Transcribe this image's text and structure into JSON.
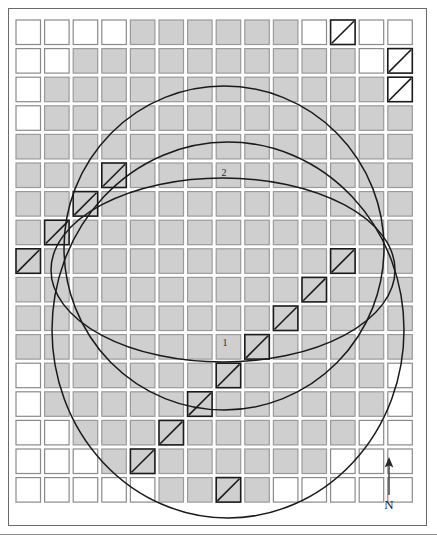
{
  "figure": {
    "type": "map-diagram",
    "title": "",
    "background_color": "#ffffff",
    "frame": {
      "x": 8,
      "y": 8,
      "width": 419,
      "height": 518,
      "stroke": "#6a6a6a"
    }
  },
  "grid": {
    "cols": 14,
    "rows": 17,
    "origin_x": 16,
    "origin_y": 20,
    "pitch_x": 28.6,
    "pitch_y": 28.6,
    "cell_size": 24.5,
    "cell_stroke": "#8a8a8a",
    "cell_stroke_shaded": "#9a9a9a",
    "cell_fill_plain": "#ffffff",
    "cell_fill_shaded": "#cfcfcf",
    "hatch_stroke": "#1a1a1a"
  },
  "shapes": [
    {
      "id": "2",
      "name": "circle-2",
      "kind": "circle",
      "label": "2",
      "label_x": 224,
      "label_y": 172,
      "cx": 224,
      "cy": 248,
      "rx": 160,
      "ry": 162,
      "rotation": 0,
      "stroke": "#1a1a1a",
      "fill": "none"
    },
    {
      "id": "1",
      "name": "circle-1",
      "kind": "circle",
      "label": "1",
      "label_x": 225,
      "label_y": 342,
      "cx": 228,
      "cy": 330,
      "rx": 176,
      "ry": 188,
      "rotation": 0,
      "stroke": "#1a1a1a",
      "fill": "none"
    },
    {
      "id": "ellipse",
      "name": "ellipse-overlay",
      "kind": "ellipse",
      "label": "",
      "cx": 223,
      "cy": 270,
      "rx": 172,
      "ry": 92,
      "rotation": 0,
      "stroke": "#1a1a1a",
      "fill": "none"
    }
  ],
  "shaded_cells": [
    [
      0,
      4
    ],
    [
      0,
      5
    ],
    [
      0,
      6
    ],
    [
      0,
      7
    ],
    [
      0,
      8
    ],
    [
      0,
      9
    ],
    [
      1,
      2
    ],
    [
      1,
      3
    ],
    [
      1,
      4
    ],
    [
      1,
      5
    ],
    [
      1,
      6
    ],
    [
      1,
      7
    ],
    [
      1,
      8
    ],
    [
      1,
      9
    ],
    [
      1,
      10
    ],
    [
      1,
      11
    ],
    [
      2,
      1
    ],
    [
      2,
      2
    ],
    [
      2,
      3
    ],
    [
      2,
      4
    ],
    [
      2,
      5
    ],
    [
      2,
      6
    ],
    [
      2,
      7
    ],
    [
      2,
      8
    ],
    [
      2,
      9
    ],
    [
      2,
      10
    ],
    [
      2,
      11
    ],
    [
      2,
      12
    ],
    [
      3,
      1
    ],
    [
      3,
      2
    ],
    [
      3,
      3
    ],
    [
      3,
      4
    ],
    [
      3,
      5
    ],
    [
      3,
      6
    ],
    [
      3,
      7
    ],
    [
      3,
      8
    ],
    [
      3,
      9
    ],
    [
      3,
      10
    ],
    [
      3,
      11
    ],
    [
      3,
      12
    ],
    [
      3,
      13
    ],
    [
      4,
      0
    ],
    [
      4,
      1
    ],
    [
      4,
      2
    ],
    [
      4,
      3
    ],
    [
      4,
      4
    ],
    [
      4,
      5
    ],
    [
      4,
      6
    ],
    [
      4,
      7
    ],
    [
      4,
      8
    ],
    [
      4,
      9
    ],
    [
      4,
      10
    ],
    [
      4,
      11
    ],
    [
      4,
      12
    ],
    [
      4,
      13
    ],
    [
      5,
      0
    ],
    [
      5,
      1
    ],
    [
      5,
      2
    ],
    [
      5,
      3
    ],
    [
      5,
      4
    ],
    [
      5,
      5
    ],
    [
      5,
      6
    ],
    [
      5,
      7
    ],
    [
      5,
      8
    ],
    [
      5,
      9
    ],
    [
      5,
      10
    ],
    [
      5,
      11
    ],
    [
      5,
      12
    ],
    [
      5,
      13
    ],
    [
      6,
      0
    ],
    [
      6,
      1
    ],
    [
      6,
      2
    ],
    [
      6,
      3
    ],
    [
      6,
      4
    ],
    [
      6,
      5
    ],
    [
      6,
      6
    ],
    [
      6,
      7
    ],
    [
      6,
      8
    ],
    [
      6,
      9
    ],
    [
      6,
      10
    ],
    [
      6,
      11
    ],
    [
      6,
      12
    ],
    [
      6,
      13
    ],
    [
      7,
      0
    ],
    [
      7,
      1
    ],
    [
      7,
      2
    ],
    [
      7,
      3
    ],
    [
      7,
      4
    ],
    [
      7,
      5
    ],
    [
      7,
      6
    ],
    [
      7,
      7
    ],
    [
      7,
      8
    ],
    [
      7,
      9
    ],
    [
      7,
      10
    ],
    [
      7,
      11
    ],
    [
      7,
      12
    ],
    [
      7,
      13
    ],
    [
      8,
      0
    ],
    [
      8,
      1
    ],
    [
      8,
      2
    ],
    [
      8,
      3
    ],
    [
      8,
      4
    ],
    [
      8,
      5
    ],
    [
      8,
      6
    ],
    [
      8,
      7
    ],
    [
      8,
      8
    ],
    [
      8,
      9
    ],
    [
      8,
      10
    ],
    [
      8,
      11
    ],
    [
      8,
      12
    ],
    [
      8,
      13
    ],
    [
      9,
      0
    ],
    [
      9,
      1
    ],
    [
      9,
      2
    ],
    [
      9,
      3
    ],
    [
      9,
      4
    ],
    [
      9,
      5
    ],
    [
      9,
      6
    ],
    [
      9,
      7
    ],
    [
      9,
      8
    ],
    [
      9,
      9
    ],
    [
      9,
      10
    ],
    [
      9,
      11
    ],
    [
      9,
      12
    ],
    [
      9,
      13
    ],
    [
      10,
      0
    ],
    [
      10,
      1
    ],
    [
      10,
      2
    ],
    [
      10,
      3
    ],
    [
      10,
      4
    ],
    [
      10,
      5
    ],
    [
      10,
      6
    ],
    [
      10,
      7
    ],
    [
      10,
      8
    ],
    [
      10,
      9
    ],
    [
      10,
      10
    ],
    [
      10,
      11
    ],
    [
      10,
      12
    ],
    [
      10,
      13
    ],
    [
      11,
      0
    ],
    [
      11,
      1
    ],
    [
      11,
      2
    ],
    [
      11,
      3
    ],
    [
      11,
      4
    ],
    [
      11,
      5
    ],
    [
      11,
      6
    ],
    [
      11,
      7
    ],
    [
      11,
      8
    ],
    [
      11,
      9
    ],
    [
      11,
      10
    ],
    [
      11,
      11
    ],
    [
      11,
      12
    ],
    [
      11,
      13
    ],
    [
      12,
      1
    ],
    [
      12,
      2
    ],
    [
      12,
      3
    ],
    [
      12,
      4
    ],
    [
      12,
      5
    ],
    [
      12,
      6
    ],
    [
      12,
      7
    ],
    [
      12,
      8
    ],
    [
      12,
      9
    ],
    [
      12,
      10
    ],
    [
      12,
      11
    ],
    [
      12,
      12
    ],
    [
      13,
      1
    ],
    [
      13,
      2
    ],
    [
      13,
      3
    ],
    [
      13,
      4
    ],
    [
      13,
      5
    ],
    [
      13,
      6
    ],
    [
      13,
      7
    ],
    [
      13,
      8
    ],
    [
      13,
      9
    ],
    [
      13,
      10
    ],
    [
      13,
      11
    ],
    [
      13,
      12
    ],
    [
      14,
      2
    ],
    [
      14,
      3
    ],
    [
      14,
      4
    ],
    [
      14,
      5
    ],
    [
      14,
      6
    ],
    [
      14,
      7
    ],
    [
      14,
      8
    ],
    [
      14,
      9
    ],
    [
      14,
      10
    ],
    [
      14,
      11
    ],
    [
      15,
      3
    ],
    [
      15,
      4
    ],
    [
      15,
      5
    ],
    [
      15,
      6
    ],
    [
      15,
      7
    ],
    [
      15,
      8
    ],
    [
      15,
      9
    ],
    [
      15,
      10
    ],
    [
      16,
      5
    ],
    [
      16,
      6
    ],
    [
      16,
      7
    ],
    [
      16,
      8
    ]
  ],
  "hatched_cells": [
    [
      0,
      11
    ],
    [
      1,
      13
    ],
    [
      2,
      13
    ],
    [
      5,
      3
    ],
    [
      6,
      2
    ],
    [
      7,
      1
    ],
    [
      8,
      0
    ],
    [
      8,
      11
    ],
    [
      9,
      10
    ],
    [
      10,
      9
    ],
    [
      11,
      8
    ],
    [
      12,
      7
    ],
    [
      13,
      6
    ],
    [
      14,
      5
    ],
    [
      15,
      4
    ],
    [
      16,
      7
    ]
  ],
  "north_arrow": {
    "name": "north-arrow",
    "label": "N",
    "x": 372,
    "y": 455,
    "direction": "up"
  }
}
